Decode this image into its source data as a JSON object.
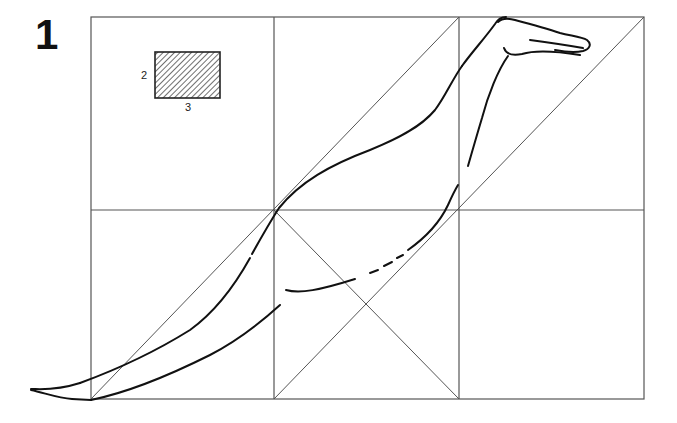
{
  "figure": {
    "number": "1",
    "inset": {
      "height_label": "2",
      "width_label": "3"
    },
    "grid": {
      "left": 91,
      "right": 644,
      "top": 17,
      "bottom": 399,
      "col_lines": [
        274,
        459
      ],
      "row_lines": [
        210
      ],
      "line_color": "#555555"
    },
    "drawing_color": "#111111"
  }
}
